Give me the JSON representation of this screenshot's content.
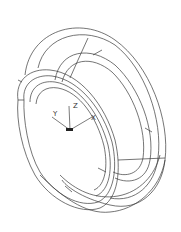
{
  "drawing": {
    "type": "wireframe-torus-ring",
    "stroke_color": "#3a3a3a",
    "background": "#ffffff"
  },
  "ucs_icon": {
    "axes": [
      {
        "label": "Z"
      },
      {
        "label": "X"
      },
      {
        "label": "Y"
      }
    ]
  }
}
